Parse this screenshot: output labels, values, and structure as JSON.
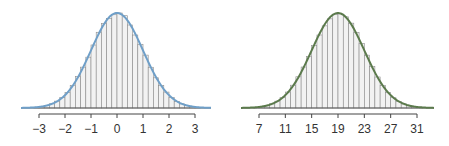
{
  "chart_data": [
    {
      "type": "bar",
      "title": "",
      "xlabel": "",
      "ylabel": "",
      "description": "Histogram of standard normal sample with fitted normal density curve",
      "distribution": {
        "mean": 0,
        "sd": 1
      },
      "xlim": [
        -3.7,
        3.7
      ],
      "bin_width": 0.2,
      "ticks": [
        -3,
        -2,
        -1,
        0,
        1,
        2,
        3
      ],
      "tick_labels": [
        "−3",
        "−2",
        "−1",
        "0",
        "1",
        "2",
        "3"
      ],
      "grid": false,
      "legend": null,
      "curve_color": "#6f9fc8",
      "bar_stroke": "#8a8a8a",
      "bar_fill": "#f2f2f2"
    },
    {
      "type": "bar",
      "title": "",
      "xlabel": "",
      "ylabel": "",
      "description": "Histogram of normal sample (mean 19, sd 4) with fitted normal density curve",
      "distribution": {
        "mean": 19,
        "sd": 4
      },
      "xlim": [
        4.2,
        33.8
      ],
      "bin_width": 0.8,
      "ticks": [
        7,
        11,
        15,
        19,
        23,
        27,
        31
      ],
      "tick_labels": [
        "7",
        "11",
        "15",
        "19",
        "23",
        "27",
        "31"
      ],
      "grid": false,
      "legend": null,
      "curve_color": "#5b7a4c",
      "bar_stroke": "#8a8a8a",
      "bar_fill": "#f2f2f2"
    }
  ],
  "layout": {
    "panels": [
      {
        "tick_first_px": 39,
        "tick_last_px": 195,
        "baseline_y": 108,
        "peak_y": 13,
        "axis_y": 114,
        "line_left": 21,
        "line_right": 211
      },
      {
        "tick_first_px": 259,
        "tick_last_px": 417,
        "baseline_y": 108,
        "peak_y": 13,
        "axis_y": 114,
        "line_left": 241,
        "line_right": 434
      }
    ]
  }
}
